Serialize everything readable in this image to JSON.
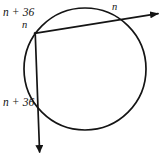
{
  "figure": {
    "kind": "circle-with-two-secants",
    "background_color": "#ffffff",
    "stroke_color": "#141414",
    "labels": {
      "arc_upper_left": "n + 36",
      "angle_vertex": "n",
      "arc_upper_right": "n",
      "arc_lower_left": "n + 36"
    },
    "circle": {
      "center_x": 85,
      "center_y": 69,
      "radius": 61
    },
    "secant_ray": {
      "from_x": 36,
      "from_y": 33,
      "to_x": 161,
      "to_y": 13,
      "intersects_circle_at_x": 126,
      "intersects_circle_at_y": 27,
      "arrow": "end"
    },
    "vertical_ray": {
      "from_x": 36,
      "from_y": 33,
      "to_x": 40,
      "to_y": 157,
      "intersects_circle_at_x": 38,
      "intersects_circle_at_y": 105,
      "arrow": "end"
    }
  }
}
